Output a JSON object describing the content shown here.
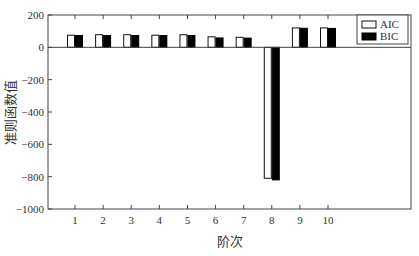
{
  "chart_data": {
    "type": "bar",
    "title": "",
    "xlabel": "阶次",
    "ylabel": "准则函数值",
    "categories": [
      "1",
      "2",
      "3",
      "4",
      "5",
      "6",
      "7",
      "8",
      "9",
      "10"
    ],
    "series": [
      {
        "name": "AIC",
        "fill": "#ffffff",
        "stroke": "#111111",
        "values": [
          75,
          78,
          78,
          75,
          78,
          65,
          62,
          -810,
          120,
          120
        ]
      },
      {
        "name": "BIC",
        "fill": "#000000",
        "stroke": "#000000",
        "values": [
          73,
          73,
          73,
          73,
          73,
          58,
          57,
          -820,
          118,
          117
        ]
      }
    ],
    "ylim": [
      -1000,
      200
    ],
    "yticks": [
      200,
      0,
      -200,
      -400,
      -600,
      -800,
      -1000
    ],
    "xlim": [
      0.3,
      11.3
    ],
    "grid": false,
    "legend_position": "upper right"
  }
}
